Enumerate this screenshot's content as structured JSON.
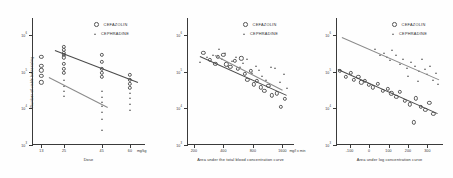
{
  "figure": {
    "background": "#fefefe",
    "axis_color": "#3a3a3a",
    "marker_color": "#5a5a5a",
    "fit_line_color": "#8a8a8a"
  },
  "legend": {
    "series": [
      {
        "label": "CEFAZOLIN",
        "marker": "circle-marker"
      },
      {
        "label": "CEPHRADINE",
        "marker": "triangle-marker"
      }
    ]
  },
  "chart_data": [
    {
      "type": "scatter",
      "title": "",
      "panel": "left",
      "xlabel": "Dose",
      "xunit": "mg/kg",
      "ylabel": "Number of viable bacteria/mg",
      "xscale": "linear",
      "yscale": "log",
      "xticks": [
        13,
        25,
        45,
        60
      ],
      "xticklabels": [
        "13",
        "25",
        "45",
        "60"
      ],
      "yticks": [
        1000000,
        100000,
        10000,
        1000
      ],
      "yticklabels": [
        "10",
        "10",
        "10",
        "10"
      ],
      "yexponents": [
        "6",
        "5",
        "4",
        "3"
      ],
      "ylim": [
        1000,
        3000000
      ],
      "xlim": [
        8,
        68
      ],
      "grid": false,
      "legend_position": "top-right",
      "series": [
        {
          "name": "CEFAZOLIN",
          "marker": "circle",
          "points": [
            [
              13,
              260000
            ],
            [
              13,
              150000
            ],
            [
              13,
              110000
            ],
            [
              13,
              78000
            ],
            [
              13,
              52000
            ],
            [
              25,
              480000
            ],
            [
              25,
              400000
            ],
            [
              25,
              330000
            ],
            [
              25,
              300000
            ],
            [
              25,
              250000
            ],
            [
              25,
              170000
            ],
            [
              25,
              120000
            ],
            [
              25,
              95000
            ],
            [
              45,
              300000
            ],
            [
              45,
              185000
            ],
            [
              45,
              120000
            ],
            [
              45,
              95000
            ],
            [
              45,
              72000
            ],
            [
              60,
              85000
            ],
            [
              60,
              62000
            ],
            [
              60,
              48000
            ],
            [
              60,
              36000
            ]
          ],
          "fit_line": {
            "x": [
              20,
              64
            ],
            "y": [
              390000,
              52000
            ]
          }
        },
        {
          "name": "CEPHRADINE",
          "marker": "triangle",
          "points": [
            [
              25,
              62000
            ],
            [
              25,
              40000
            ],
            [
              25,
              30000
            ],
            [
              25,
              22000
            ],
            [
              45,
              30000
            ],
            [
              45,
              21000
            ],
            [
              45,
              15000
            ],
            [
              45,
              12000
            ],
            [
              45,
              8000
            ],
            [
              45,
              5200
            ],
            [
              45,
              2600
            ],
            [
              60,
              26000
            ],
            [
              60,
              19000
            ],
            [
              60,
              13000
            ],
            [
              60,
              9000
            ]
          ],
          "fit_line": {
            "x": [
              17,
              48
            ],
            "y": [
              72000,
              11000
            ]
          }
        }
      ]
    },
    {
      "type": "scatter",
      "title": "",
      "panel": "middle",
      "xlabel": "Area under the total blood concentration curve",
      "xunit": "mg/l x min",
      "ylabel": "",
      "xscale": "log",
      "yscale": "log",
      "xticks": [
        200,
        400,
        800,
        1600
      ],
      "xticklabels": [
        "200",
        "400",
        "800",
        "1600"
      ],
      "yticks": [
        1000000,
        100000,
        10000,
        1000
      ],
      "yexponents": [
        "6",
        "5",
        "4",
        "3"
      ],
      "ylim": [
        1000,
        3000000
      ],
      "xlim": [
        170,
        2100
      ],
      "grid": false,
      "legend_position": "top-right",
      "series": [
        {
          "name": "CEFAZOLIN",
          "marker": "circle",
          "points": [
            [
              250,
              330000
            ],
            [
              290,
              210000
            ],
            [
              330,
              165000
            ],
            [
              350,
              260000
            ],
            [
              400,
              300000
            ],
            [
              430,
              160000
            ],
            [
              470,
              135000
            ],
            [
              520,
              200000
            ],
            [
              560,
              120000
            ],
            [
              610,
              235000
            ],
            [
              660,
              88000
            ],
            [
              700,
              62000
            ],
            [
              760,
              105000
            ],
            [
              820,
              46000
            ],
            [
              880,
              58000
            ],
            [
              960,
              38000
            ],
            [
              1050,
              30000
            ],
            [
              1150,
              42000
            ],
            [
              1250,
              23000
            ],
            [
              1400,
              26000
            ],
            [
              1550,
              11000
            ],
            [
              1700,
              18000
            ]
          ],
          "fit_line": {
            "x": [
              230,
              1750
            ],
            "y": [
              265000,
              23000
            ]
          }
        },
        {
          "name": "CEPHRADINE",
          "marker": "triangle",
          "points": [
            [
              230,
              185000
            ],
            [
              270,
              260000
            ],
            [
              310,
              300000
            ],
            [
              360,
              420000
            ],
            [
              390,
              230000
            ],
            [
              420,
              330000
            ],
            [
              450,
              150000
            ],
            [
              490,
              195000
            ],
            [
              540,
              260000
            ],
            [
              590,
              135000
            ],
            [
              640,
              175000
            ],
            [
              700,
              230000
            ],
            [
              780,
              95000
            ],
            [
              850,
              150000
            ],
            [
              920,
              115000
            ],
            [
              1000,
              78000
            ],
            [
              1100,
              60000
            ],
            [
              1220,
              135000
            ],
            [
              1350,
              130000
            ],
            [
              1500,
              52000
            ],
            [
              1650,
              88000
            ],
            [
              1800,
              36000
            ]
          ],
          "fit_line": {
            "x": [
              330,
              1600
            ],
            "y": [
              300000,
              34000
            ]
          }
        }
      ]
    },
    {
      "type": "scatter",
      "title": "",
      "panel": "right",
      "xlabel": "Area under log concentration curve",
      "xunit": "min",
      "ylabel": "",
      "xscale": "linear",
      "yscale": "log",
      "xticks": [
        -100,
        0,
        100,
        200,
        300
      ],
      "xticklabels": [
        "-100",
        "0",
        "100",
        "200",
        "300"
      ],
      "yticks": [
        1000000,
        100000,
        10000,
        1000
      ],
      "yexponents": [
        "6",
        "5",
        "4",
        "3"
      ],
      "ylim": [
        1000,
        3000000
      ],
      "xlim": [
        -170,
        380
      ],
      "grid": false,
      "legend_position": "top-right",
      "series": [
        {
          "name": "CEFAZOLIN",
          "marker": "circle",
          "points": [
            [
              -150,
              105000
            ],
            [
              -120,
              72000
            ],
            [
              -95,
              95000
            ],
            [
              -80,
              62000
            ],
            [
              -55,
              75000
            ],
            [
              -40,
              52000
            ],
            [
              -20,
              58000
            ],
            [
              0,
              44000
            ],
            [
              20,
              38000
            ],
            [
              45,
              48000
            ],
            [
              70,
              30000
            ],
            [
              95,
              34000
            ],
            [
              115,
              26000
            ],
            [
              140,
              21000
            ],
            [
              160,
              28000
            ],
            [
              185,
              16000
            ],
            [
              210,
              13000
            ],
            [
              240,
              19000
            ],
            [
              265,
              11000
            ],
            [
              290,
              9000
            ],
            [
              310,
              14000
            ],
            [
              330,
              7000
            ],
            [
              230,
              4200
            ]
          ],
          "fit_line": {
            "x": [
              -160,
              350
            ],
            "y": [
              120000,
              7500
            ]
          }
        },
        {
          "name": "CEPHRADINE",
          "marker": "triangle",
          "points": [
            [
              30,
              420000
            ],
            [
              55,
              300000
            ],
            [
              75,
              330000
            ],
            [
              90,
              260000
            ],
            [
              110,
              210000
            ],
            [
              120,
              390000
            ],
            [
              140,
              300000
            ],
            [
              160,
              165000
            ],
            [
              175,
              230000
            ],
            [
              195,
              130000
            ],
            [
              215,
              185000
            ],
            [
              235,
              150000
            ],
            [
              255,
              105000
            ],
            [
              270,
              230000
            ],
            [
              285,
              120000
            ],
            [
              300,
              88000
            ],
            [
              315,
              145000
            ],
            [
              330,
              62000
            ],
            [
              345,
              95000
            ],
            [
              355,
              48000
            ],
            [
              200,
              78000
            ],
            [
              250,
              58000
            ]
          ],
          "fit_line": {
            "x": [
              -140,
              360
            ],
            "y": [
              900000,
              62000
            ]
          }
        }
      ]
    }
  ]
}
